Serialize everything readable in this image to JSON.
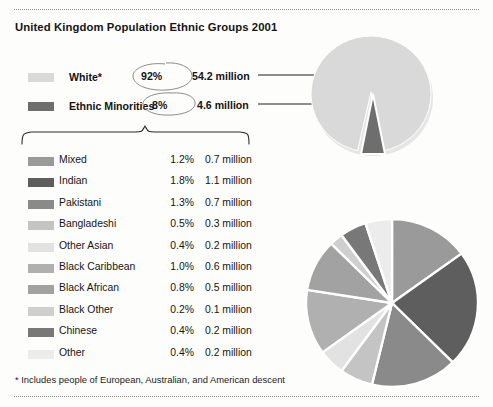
{
  "title": "United Kingdom Population Ethnic Groups 2001",
  "footnote": "* Includes people of European, Australian, and American descent",
  "top_legend": [
    {
      "label": "White*",
      "percent": "92%",
      "millions": "54.2 million",
      "color": "#d9d9d9"
    },
    {
      "label": "Ethnic Minorities",
      "percent": "8%",
      "millions": "4.6 million",
      "color": "#6e6e6e"
    }
  ],
  "breakdown": [
    {
      "label": "Mixed",
      "percent": "1.2%",
      "millions": "0.7 million",
      "color": "#9a9a9a"
    },
    {
      "label": "Indian",
      "percent": "1.8%",
      "millions": "1.1 million",
      "color": "#5e5e5e"
    },
    {
      "label": "Pakistani",
      "percent": "1.3%",
      "millions": "0.7 million",
      "color": "#8a8a8a"
    },
    {
      "label": "Bangladeshi",
      "percent": "0.5%",
      "millions": "0.3 million",
      "color": "#c4c4c4"
    },
    {
      "label": "Other Asian",
      "percent": "0.4%",
      "millions": "0.2 million",
      "color": "#e2e2e2"
    },
    {
      "label": "Black Caribbean",
      "percent": "1.0%",
      "millions": "0.6 million",
      "color": "#b0b0b0"
    },
    {
      "label": "Black African",
      "percent": "0.8%",
      "millions": "0.5 million",
      "color": "#a2a2a2"
    },
    {
      "label": "Black Other",
      "percent": "0.2%",
      "millions": "0.1 million",
      "color": "#cfcfcf"
    },
    {
      "label": "Chinese",
      "percent": "0.4%",
      "millions": "0.2 million",
      "color": "#787878"
    },
    {
      "label": "Other",
      "percent": "0.4%",
      "millions": "0.2 million",
      "color": "#ececec"
    }
  ],
  "chart_data": [
    {
      "type": "pie",
      "title": "United Kingdom Population Ethnic Groups 2001",
      "name": "overall-population-pie",
      "categories": [
        "White*",
        "Ethnic Minorities"
      ],
      "values": [
        92,
        8
      ],
      "value_unit": "percent",
      "absolute_values": [
        54.2,
        4.6
      ],
      "absolute_unit": "million",
      "colors": [
        "#d9d9d9",
        "#6e6e6e"
      ],
      "exploded": [
        "Ethnic Minorities"
      ],
      "start_angle": 180,
      "direction": "clockwise",
      "legend": "left",
      "annotations": [
        "92% circled by hand",
        "8% circled by hand",
        "leader line from 54.2 million to White slice",
        "leader line from 4.6 million to Ethnic Minorities slice"
      ]
    },
    {
      "type": "pie",
      "title": "Ethnic Minorities breakdown",
      "name": "ethnic-minorities-pie",
      "categories": [
        "Mixed",
        "Indian",
        "Pakistani",
        "Bangladeshi",
        "Other Asian",
        "Black Caribbean",
        "Black African",
        "Black Other",
        "Chinese",
        "Other"
      ],
      "values": [
        1.2,
        1.8,
        1.3,
        0.5,
        0.4,
        1.0,
        0.8,
        0.2,
        0.4,
        0.4
      ],
      "value_unit": "percent of UK population",
      "absolute_values": [
        0.7,
        1.1,
        0.7,
        0.3,
        0.2,
        0.6,
        0.5,
        0.1,
        0.2,
        0.2
      ],
      "absolute_unit": "million",
      "colors": [
        "#9a9a9a",
        "#5e5e5e",
        "#8a8a8a",
        "#c4c4c4",
        "#e2e2e2",
        "#b0b0b0",
        "#a2a2a2",
        "#cfcfcf",
        "#787878",
        "#ececec"
      ],
      "start_angle": -90,
      "direction": "clockwise",
      "legend": "left-table",
      "grid": false
    }
  ]
}
